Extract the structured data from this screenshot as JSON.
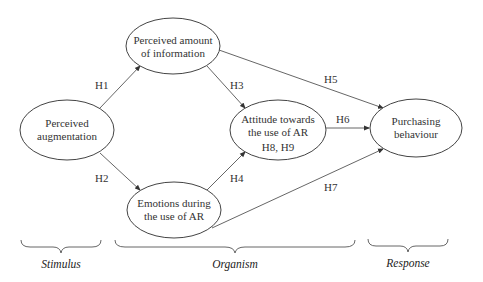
{
  "nodes": {
    "perceived_augmentation": {
      "line1": "Perceived",
      "line2": "augmentation"
    },
    "perceived_info": {
      "line1": "Perceived amount",
      "line2": "of information"
    },
    "emotions": {
      "line1": "Emotions during",
      "line2": "the use of AR"
    },
    "attitude": {
      "line1": "Attitude towards",
      "line2": "the use of AR",
      "line3": "H8, H9"
    },
    "purchasing": {
      "line1": "Purchasing",
      "line2": "behaviour"
    }
  },
  "edges": {
    "h1": "H1",
    "h2": "H2",
    "h3": "H3",
    "h4": "H4",
    "h5": "H5",
    "h6": "H6",
    "h7": "H7"
  },
  "stages": {
    "stimulus": "Stimulus",
    "organism": "Organism",
    "response": "Response"
  },
  "colors": {
    "stroke": "#444444",
    "text": "#333333",
    "background": "#ffffff"
  }
}
